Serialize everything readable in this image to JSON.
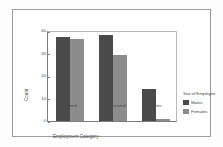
{
  "chart_data": {
    "type": "bar",
    "title": "",
    "categories": [
      "Salaried",
      "Professional",
      "Other"
    ],
    "series": [
      {
        "name": "Males",
        "values": [
          37,
          38,
          14
        ],
        "color": "#4a4a4a"
      },
      {
        "name": "Females",
        "values": [
          36,
          29,
          1
        ],
        "color": "#8c8c8c"
      }
    ],
    "xlabel": "Employment Category",
    "ylabel": "Count",
    "ylim": [
      0,
      40
    ],
    "yticks": [
      0,
      10,
      20,
      30,
      40
    ],
    "ytick_labels": [
      "0",
      "10",
      "20",
      "30",
      "40"
    ],
    "grid": false,
    "legend": {
      "title": "Sex of Employee",
      "position": "right",
      "entries": [
        "Males",
        "Females"
      ]
    }
  },
  "axis": {
    "y_title": "Count",
    "x_title": "Employment Category",
    "ticks": [
      {
        "value": "40"
      },
      {
        "value": "30"
      },
      {
        "value": "20"
      },
      {
        "value": "10"
      },
      {
        "value": "0"
      }
    ]
  },
  "categories": [
    {
      "label": "Salaried"
    },
    {
      "label": "Professional"
    },
    {
      "label": "Other"
    }
  ],
  "legend": {
    "title": "Sex of Employee",
    "items": [
      {
        "label": "Males"
      },
      {
        "label": "Females"
      }
    ]
  }
}
